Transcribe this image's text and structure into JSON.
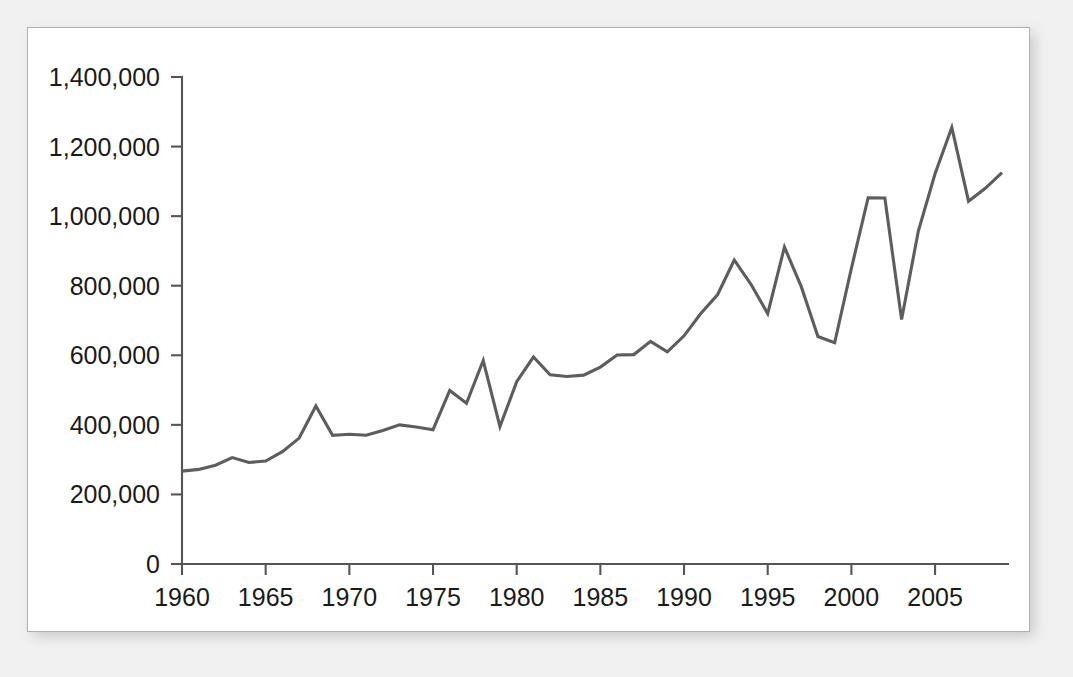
{
  "panel": {
    "background_color": "#ffffff",
    "border_color": "#b0b0b0",
    "page_background_color": "#f1f1f1"
  },
  "chart_data": {
    "type": "line",
    "title": "",
    "subtitle": "",
    "xlabel": "",
    "ylabel": "",
    "grid": false,
    "legend": false,
    "legend_position": "none",
    "line_color": "#5d5d5d",
    "axis_color": "#555555",
    "xlim": [
      1960,
      2009
    ],
    "ylim": [
      0,
      1400000
    ],
    "y_tick_values": [
      0,
      200000,
      400000,
      600000,
      800000,
      1000000,
      1200000,
      1400000
    ],
    "y_tick_labels": [
      "0",
      "200,000",
      "400,000",
      "600,000",
      "800,000",
      "1,000,000",
      "1,200,000",
      "1,400,000"
    ],
    "x_tick_values": [
      1960,
      1965,
      1970,
      1975,
      1980,
      1985,
      1990,
      1995,
      2000,
      2005
    ],
    "x_tick_labels": [
      "1960",
      "1965",
      "1970",
      "1975",
      "1980",
      "1985",
      "1990",
      "1995",
      "2000",
      "2005"
    ],
    "x": [
      1960,
      1961,
      1962,
      1963,
      1964,
      1965,
      1966,
      1967,
      1968,
      1969,
      1970,
      1971,
      1972,
      1973,
      1974,
      1975,
      1976,
      1977,
      1978,
      1979,
      1980,
      1981,
      1982,
      1983,
      1984,
      1985,
      1986,
      1987,
      1988,
      1989,
      1990,
      1991,
      1992,
      1993,
      1994,
      1995,
      1996,
      1997,
      1998,
      1999,
      2000,
      2001,
      2002,
      2003,
      2004,
      2005,
      2006,
      2007,
      2008,
      2009
    ],
    "values": [
      267000,
      272000,
      284000,
      306000,
      292000,
      296000,
      323000,
      362000,
      454000,
      370000,
      373000,
      370000,
      384000,
      400000,
      394000,
      386000,
      499000,
      462000,
      585000,
      395000,
      524000,
      595000,
      544000,
      539000,
      543000,
      566000,
      601000,
      602000,
      640000,
      610000,
      656000,
      720000,
      774000,
      874000,
      804000,
      720000,
      911000,
      798000,
      654000,
      636000,
      850000,
      1053000,
      1052000,
      703000,
      957000,
      1122000,
      1255000,
      1043000,
      1080000,
      1125000
    ]
  }
}
